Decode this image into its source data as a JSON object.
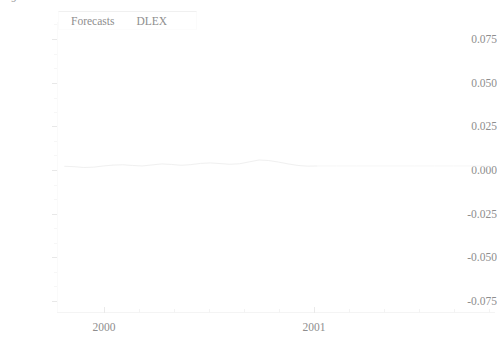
{
  "figure": {
    "corner_glyph": "9",
    "background_color": "#ffffff",
    "ink_color": "#8e8e8e",
    "series_color": "#f3f3f3"
  },
  "legend": {
    "entries": [
      {
        "label": "Forecasts",
        "icon": "line-swatch-icon"
      },
      {
        "label": "DLEX",
        "icon": "line-swatch-icon"
      }
    ]
  },
  "axes": {
    "y_labels": [
      "0.075",
      "0.050",
      "0.025",
      "0.000",
      "-0.025",
      "-0.050",
      "-0.075"
    ],
    "x_labels": [
      "2000",
      "2001"
    ]
  },
  "chart_data": {
    "type": "line",
    "title": "",
    "subtitle": "",
    "xlabel": "",
    "ylabel": "",
    "ylim": [
      -0.085,
      0.085
    ],
    "yticks": [
      0.075,
      0.05,
      0.025,
      0.0,
      -0.025,
      -0.05,
      -0.075
    ],
    "ytick_labels": [
      "0.075",
      "0.050",
      "0.025",
      "0.000",
      "-0.025",
      "-0.050",
      "-0.075"
    ],
    "xlim": [
      "1999.8",
      "2001.6"
    ],
    "xticks": [
      "2000",
      "2001"
    ],
    "xtick_labels": [
      "2000",
      "2001"
    ],
    "grid": false,
    "legend_position": "top-left",
    "annotations": [],
    "series": [
      {
        "name": "DLEX",
        "color": "#f0f0f0",
        "style": "solid",
        "comment": "observed first-difference of log exchange rate, hovers near zero",
        "x": [
          1999.83,
          1999.87,
          1999.91,
          1999.95,
          1999.99,
          2000.03,
          2000.07,
          2000.11,
          2000.15,
          2000.19,
          2000.23,
          2000.27,
          2000.31,
          2000.35,
          2000.39,
          2000.43,
          2000.47,
          2000.51,
          2000.55,
          2000.59,
          2000.63,
          2000.67,
          2000.71,
          2000.75,
          2000.79,
          2000.83,
          2000.87
        ],
        "values": [
          0.0004,
          0.0002,
          -0.0003,
          -0.0001,
          0.0006,
          0.0011,
          0.0013,
          0.0009,
          0.0006,
          0.0012,
          0.0018,
          0.0015,
          0.001,
          0.0014,
          0.0021,
          0.0024,
          0.002,
          0.0016,
          0.0019,
          0.003,
          0.0041,
          0.0038,
          0.0029,
          0.0018,
          0.0009,
          0.0005,
          0.0006
        ]
      },
      {
        "name": "Forecasts",
        "color": "#f6f6f6",
        "style": "solid",
        "comment": "out-of-sample forecast, essentially flat near zero",
        "x": [
          2000.87,
          2000.95,
          2001.03,
          2001.11,
          2001.19,
          2001.27,
          2001.35,
          2001.43,
          2001.51,
          2001.58
        ],
        "values": [
          0.0006,
          0.0006,
          0.0006,
          0.0006,
          0.0006,
          0.0006,
          0.0006,
          0.0006,
          0.0006,
          0.0006
        ]
      }
    ]
  }
}
